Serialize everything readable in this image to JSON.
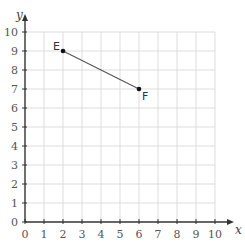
{
  "chart_data": {
    "type": "line",
    "title": "",
    "xlabel": "x",
    "ylabel": "y",
    "xlim": [
      0,
      10
    ],
    "ylim": [
      0,
      10
    ],
    "grid": true,
    "x_ticks": [
      "0",
      "1",
      "2",
      "3",
      "4",
      "5",
      "6",
      "7",
      "8",
      "9",
      "10"
    ],
    "y_ticks": [
      "0",
      "1",
      "2",
      "3",
      "4",
      "5",
      "6",
      "7",
      "8",
      "9",
      "10"
    ],
    "points": [
      {
        "label": "E",
        "x": 2,
        "y": 9
      },
      {
        "label": "F",
        "x": 6,
        "y": 7
      }
    ],
    "segments": [
      {
        "from": "E",
        "to": "F"
      }
    ]
  }
}
